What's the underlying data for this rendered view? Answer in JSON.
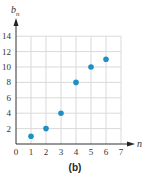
{
  "chart_data": {
    "type": "scatter",
    "title": "",
    "caption": "(b)",
    "xlabel": "n",
    "ylabel": "b_n",
    "ylabel_base": "b",
    "ylabel_sub": "n",
    "x": [
      1,
      2,
      3,
      4,
      5,
      6
    ],
    "y": [
      1,
      2,
      4,
      8,
      10,
      11
    ],
    "series": [
      {
        "name": "b_n",
        "x": [
          1,
          2,
          3,
          4,
          5,
          6
        ],
        "values": [
          1,
          2,
          4,
          8,
          10,
          11
        ]
      }
    ],
    "xlim": [
      0,
      7
    ],
    "ylim": [
      0,
      14
    ],
    "xticks": [
      "0",
      "1",
      "2",
      "3",
      "4",
      "5",
      "6",
      "7"
    ],
    "yticks": [
      "2",
      "4",
      "6",
      "8",
      "10",
      "12",
      "14"
    ],
    "grid": true,
    "legend": null,
    "point_color": "#1f8fc4",
    "grid_color": "#d9d9d9",
    "axis_color": "#333333"
  }
}
